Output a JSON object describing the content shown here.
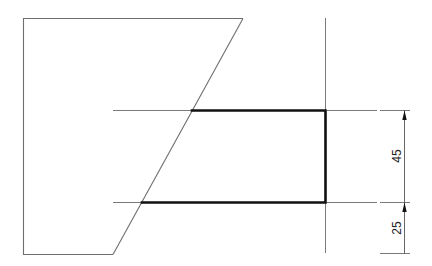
{
  "drawing": {
    "type": "technical-drawing",
    "colors": {
      "background": "#ffffff",
      "thin_line": "#7a7a7a",
      "thick_line": "#111111",
      "text": "#222222"
    },
    "dimensions": [
      {
        "label": "45",
        "from_y": 110,
        "to_y": 202,
        "orientation": "vertical"
      },
      {
        "label": "25",
        "from_y": 202,
        "to_y": 253,
        "orientation": "vertical"
      }
    ]
  }
}
